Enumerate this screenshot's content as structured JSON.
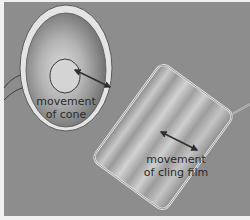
{
  "diagram": {
    "type": "loudspeaker and cling film vibration illustration",
    "colors": {
      "background": "#8d8d8d",
      "rim": "#e6e6e6",
      "cone_light": "#d8d8d8",
      "cone_dark": "#6a6a6a",
      "outline": "#3a3a3a",
      "arrow": "#2e2e2e",
      "border": "#e8e8e8"
    },
    "cone": {
      "label_line1": "movement",
      "label_line2": "of cone"
    },
    "cling_film": {
      "label_line1": "movement",
      "label_line2": "of cling film"
    }
  }
}
